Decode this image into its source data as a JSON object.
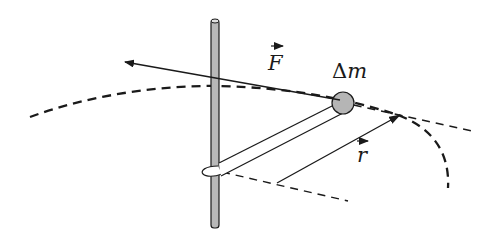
{
  "figure": {
    "labels": {
      "force": "F",
      "mass_delta": "Δ",
      "mass_symbol": "m",
      "radius": "r"
    },
    "colors": {
      "line": "#1a1a1a",
      "pole_fill": "#b8b8b8",
      "mass_fill": "#b5b5b5",
      "background": "#ffffff"
    }
  }
}
